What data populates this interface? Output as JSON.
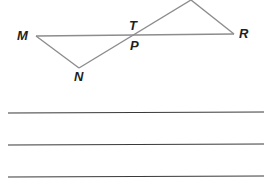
{
  "diagram": {
    "points": {
      "M": {
        "label": "M",
        "x": 36,
        "y": 36
      },
      "N": {
        "label": "N",
        "x": 79,
        "y": 68
      },
      "T": {
        "label": "T",
        "x": 136,
        "y": 35
      },
      "P": {
        "label": "P",
        "x": 136,
        "y": 35
      },
      "R": {
        "label": "R",
        "x": 234,
        "y": 34
      },
      "top": {
        "label": "",
        "x": 191,
        "y": 0
      }
    },
    "labels": {
      "M": "M",
      "N": "N",
      "T": "T",
      "P": "P",
      "R": "R"
    },
    "segments": [
      [
        "M",
        "R"
      ],
      [
        "M",
        "N"
      ],
      [
        "N",
        "top"
      ],
      [
        "top",
        "R"
      ]
    ],
    "colors": {
      "segment": "#8c8c8c",
      "answer_line": "#3a3a3a",
      "label": "#231f20"
    }
  },
  "answer_lines": {
    "count": 3,
    "y": [
      113,
      144,
      177
    ]
  }
}
